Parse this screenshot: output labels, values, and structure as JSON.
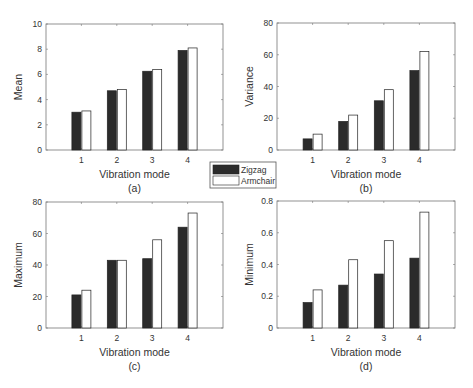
{
  "legend": {
    "entries": [
      {
        "label": "Zigzag",
        "color": "#2b2b2b"
      },
      {
        "label": "Armchair",
        "color": "#ffffff"
      }
    ]
  },
  "chart_data": [
    {
      "type": "bar",
      "panel": "(a)",
      "title": "",
      "xlabel": "Vibration mode",
      "ylabel": "Mean",
      "categories": [
        "1",
        "2",
        "3",
        "4"
      ],
      "ylim": [
        0,
        10
      ],
      "yticks": [
        "0",
        "2",
        "4",
        "6",
        "8",
        "10"
      ],
      "grid": false,
      "series": [
        {
          "name": "Zigzag",
          "values": [
            3.0,
            4.7,
            6.25,
            7.9
          ]
        },
        {
          "name": "Armchair",
          "values": [
            3.1,
            4.8,
            6.4,
            8.1
          ]
        }
      ]
    },
    {
      "type": "bar",
      "panel": "(b)",
      "title": "",
      "xlabel": "Vibration mode",
      "ylabel": "Variance",
      "categories": [
        "1",
        "2",
        "3",
        "4"
      ],
      "ylim": [
        0,
        80
      ],
      "yticks": [
        "0",
        "20",
        "40",
        "60",
        "80"
      ],
      "grid": false,
      "series": [
        {
          "name": "Zigzag",
          "values": [
            7,
            18,
            31,
            50
          ]
        },
        {
          "name": "Armchair",
          "values": [
            10,
            22,
            38,
            62
          ]
        }
      ]
    },
    {
      "type": "bar",
      "panel": "(c)",
      "title": "",
      "xlabel": "Vibration mode",
      "ylabel": "Maximum",
      "categories": [
        "1",
        "2",
        "3",
        "4"
      ],
      "ylim": [
        0,
        80
      ],
      "yticks": [
        "0",
        "20",
        "40",
        "60",
        "80"
      ],
      "grid": false,
      "series": [
        {
          "name": "Zigzag",
          "values": [
            21,
            43,
            44,
            64
          ]
        },
        {
          "name": "Armchair",
          "values": [
            24,
            43,
            56,
            73
          ]
        }
      ]
    },
    {
      "type": "bar",
      "panel": "(d)",
      "title": "",
      "xlabel": "Vibration mode",
      "ylabel": "Minimum",
      "categories": [
        "1",
        "2",
        "3",
        "4"
      ],
      "ylim": [
        0,
        0.8
      ],
      "yticks": [
        "0",
        "0.2",
        "0.4",
        "0.6",
        "0.8"
      ],
      "grid": false,
      "series": [
        {
          "name": "Zigzag",
          "values": [
            0.16,
            0.27,
            0.34,
            0.44
          ]
        },
        {
          "name": "Armchair",
          "values": [
            0.24,
            0.43,
            0.55,
            0.73
          ]
        }
      ]
    }
  ]
}
